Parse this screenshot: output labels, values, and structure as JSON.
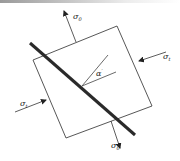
{
  "diagram": {
    "type": "stress-element-with-inclined-plane",
    "labels": {
      "sigma_top": {
        "symbol": "σ",
        "subscript": "0"
      },
      "sigma_bottom": {
        "symbol": "σ",
        "subscript": "0"
      },
      "sigma_right": {
        "symbol": "σ",
        "subscript": "t"
      },
      "sigma_left": {
        "symbol": "σ",
        "subscript": "t"
      },
      "angle": {
        "symbol": "α",
        "superscript": "′"
      }
    },
    "colors": {
      "line": "#333333",
      "plane": "#2a2a2a",
      "background": "#ffffff"
    }
  }
}
